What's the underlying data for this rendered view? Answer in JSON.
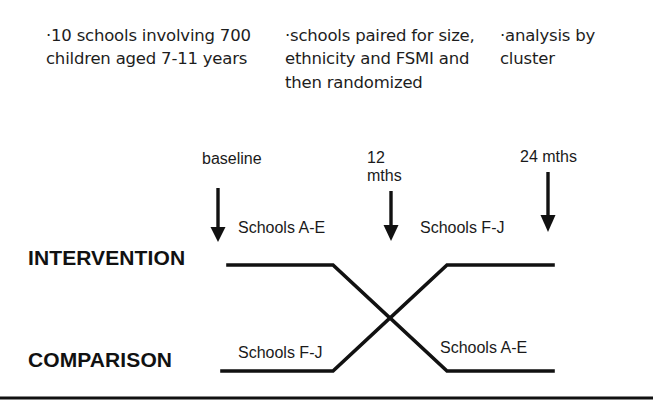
{
  "slide": {
    "title": "Cluster randomized crossover trial design"
  },
  "bullets": [
    {
      "id": "bullet-1",
      "marker": "·",
      "text": "·10 schools involving 700 children aged 7-11 years"
    },
    {
      "id": "bullet-2",
      "marker": "·",
      "text": "·schools paired for size, ethnicity and FSMI and then randomized"
    },
    {
      "id": "bullet-3",
      "marker": "·",
      "text": "·analysis by cluster"
    }
  ],
  "timeline": {
    "points": [
      {
        "label": "baseline",
        "arrow": "down-arrow"
      },
      {
        "label": "12\nmths",
        "arrow": "down-arrow"
      },
      {
        "label": "24 mths",
        "arrow": "down-arrow"
      }
    ],
    "baseline_label": "baseline",
    "twelve_months_label": "12\nmths",
    "twentyfour_months_label": "24 mths"
  },
  "arms": {
    "intervention_label": "INTERVENTION",
    "comparison_label": "COMPARISON",
    "intervention_period1": "Schools A-E",
    "intervention_period2": "Schools F-J",
    "comparison_period1": "Schools F-J",
    "comparison_period2": "Schools A-E"
  },
  "style": {
    "line_color": "#111111",
    "text_color": "#1a1a1a",
    "background": "#ffffff"
  }
}
